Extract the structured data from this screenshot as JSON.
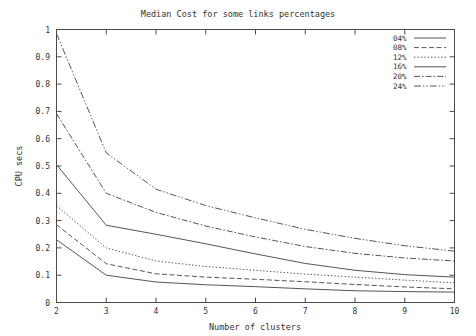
{
  "chart_data": {
    "type": "line",
    "title": "Median Cost for some links percentages",
    "xlabel": "Number of clusters",
    "ylabel": "CPU secs",
    "xlim": [
      2,
      10
    ],
    "ylim": [
      0,
      1
    ],
    "xticks": [
      "2",
      "3",
      "4",
      "5",
      "6",
      "7",
      "8",
      "9",
      "10"
    ],
    "yticks": [
      "0",
      "0.1",
      "0.2",
      "0.3",
      "0.4",
      "0.5",
      "0.6",
      "0.7",
      "0.8",
      "0.9",
      "1"
    ],
    "grid": false,
    "legend_position": "top-right",
    "x": [
      2,
      3,
      4,
      5,
      6,
      7,
      8,
      9,
      10
    ],
    "series": [
      {
        "name": "04%",
        "style": "solid",
        "values": [
          0.23,
          0.1,
          0.075,
          0.065,
          0.058,
          0.05,
          0.043,
          0.04,
          0.038
        ]
      },
      {
        "name": "08%",
        "style": "dashed",
        "values": [
          0.285,
          0.142,
          0.105,
          0.093,
          0.085,
          0.076,
          0.066,
          0.057,
          0.05
        ]
      },
      {
        "name": "12%",
        "style": "dotted",
        "values": [
          0.355,
          0.2,
          0.152,
          0.132,
          0.118,
          0.104,
          0.093,
          0.082,
          0.072
        ]
      },
      {
        "name": "16%",
        "style": "solid-thin",
        "values": [
          0.505,
          0.283,
          0.25,
          0.215,
          0.178,
          0.143,
          0.118,
          0.102,
          0.093
        ]
      },
      {
        "name": "20%",
        "style": "dash-dot",
        "values": [
          0.692,
          0.4,
          0.33,
          0.28,
          0.24,
          0.205,
          0.18,
          0.163,
          0.152
        ]
      },
      {
        "name": "24%",
        "style": "dash-dot-dot",
        "values": [
          0.985,
          0.548,
          0.415,
          0.355,
          0.31,
          0.268,
          0.235,
          0.208,
          0.188
        ]
      }
    ]
  },
  "legend": {
    "items": [
      {
        "label": "04%"
      },
      {
        "label": "08%"
      },
      {
        "label": "12%"
      },
      {
        "label": "16%"
      },
      {
        "label": "20%"
      },
      {
        "label": "24%"
      }
    ]
  }
}
